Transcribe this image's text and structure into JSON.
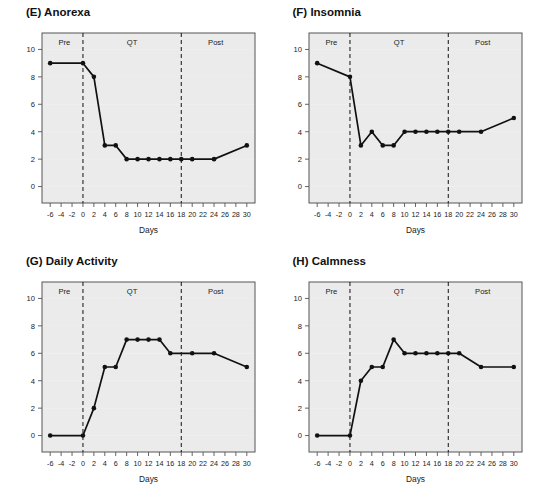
{
  "figure": {
    "width": 533,
    "height": 498,
    "background": "#ffffff",
    "panel_background": "#ebebeb",
    "series_color": "#111111",
    "divider_color": "#111111",
    "axis_color": "#555555"
  },
  "shared": {
    "xlabel": "Days",
    "xticks": [
      -6,
      -4,
      -2,
      0,
      2,
      4,
      6,
      8,
      10,
      12,
      14,
      16,
      18,
      20,
      22,
      24,
      26,
      28,
      30
    ],
    "yticks": [
      0,
      2,
      4,
      6,
      8,
      10
    ],
    "xlim": [
      -7.5,
      31.5
    ],
    "ylim": [
      -1.2,
      11.2
    ],
    "region_labels": [
      "Pre",
      "QT",
      "Post"
    ],
    "dividers": [
      0,
      18
    ]
  },
  "chart_data": [
    {
      "type": "line",
      "panel": "E",
      "title": "(E) Anorexa",
      "xlabel": "Days",
      "ylabel": "",
      "xlim": [
        -7.5,
        31.5
      ],
      "ylim": [
        -1.2,
        11.2
      ],
      "grid": false,
      "legend": "none",
      "annotations": [
        {
          "text": "Pre",
          "x": -3.4,
          "y": 10.3
        },
        {
          "text": "QT",
          "x": 9.0,
          "y": 10.3
        },
        {
          "text": "Post",
          "x": 24.3,
          "y": 10.3
        }
      ],
      "vlines": [
        0,
        18
      ],
      "x": [
        -6,
        0,
        2,
        4,
        6,
        8,
        10,
        12,
        14,
        16,
        18,
        20,
        24,
        30
      ],
      "values": [
        9,
        9,
        8,
        3,
        3,
        2,
        2,
        2,
        2,
        2,
        2,
        2,
        2,
        3
      ]
    },
    {
      "type": "line",
      "panel": "F",
      "title": "(F) Insomnia",
      "xlabel": "Days",
      "ylabel": "",
      "xlim": [
        -7.5,
        31.5
      ],
      "ylim": [
        -1.2,
        11.2
      ],
      "grid": false,
      "legend": "none",
      "annotations": [
        {
          "text": "Pre",
          "x": -3.4,
          "y": 10.3
        },
        {
          "text": "QT",
          "x": 9.0,
          "y": 10.3
        },
        {
          "text": "Post",
          "x": 24.3,
          "y": 10.3
        }
      ],
      "vlines": [
        0,
        18
      ],
      "x": [
        -6,
        0,
        2,
        4,
        6,
        8,
        10,
        12,
        14,
        16,
        18,
        20,
        24,
        30
      ],
      "values": [
        9,
        8,
        3,
        4,
        3,
        3,
        4,
        4,
        4,
        4,
        4,
        4,
        4,
        5
      ]
    },
    {
      "type": "line",
      "panel": "G",
      "title": "(G) Daily Activity",
      "xlabel": "Days",
      "ylabel": "",
      "xlim": [
        -7.5,
        31.5
      ],
      "ylim": [
        -1.2,
        11.2
      ],
      "grid": false,
      "legend": "none",
      "annotations": [
        {
          "text": "Pre",
          "x": -3.4,
          "y": 10.3
        },
        {
          "text": "QT",
          "x": 9.0,
          "y": 10.3
        },
        {
          "text": "Post",
          "x": 24.3,
          "y": 10.3
        }
      ],
      "vlines": [
        0,
        18
      ],
      "x": [
        -6,
        0,
        2,
        4,
        6,
        8,
        10,
        12,
        14,
        16,
        20,
        24,
        30
      ],
      "values": [
        0,
        0,
        2,
        5,
        5,
        7,
        7,
        7,
        7,
        6,
        6,
        6,
        5
      ]
    },
    {
      "type": "line",
      "panel": "H",
      "title": "(H) Calmness",
      "xlabel": "Days",
      "ylabel": "",
      "xlim": [
        -7.5,
        31.5
      ],
      "ylim": [
        -1.2,
        11.2
      ],
      "grid": false,
      "legend": "none",
      "annotations": [
        {
          "text": "Pre",
          "x": -3.4,
          "y": 10.3
        },
        {
          "text": "QT",
          "x": 9.0,
          "y": 10.3
        },
        {
          "text": "Post",
          "x": 24.3,
          "y": 10.3
        }
      ],
      "vlines": [
        0,
        18
      ],
      "x": [
        -6,
        0,
        2,
        4,
        6,
        8,
        10,
        12,
        14,
        16,
        18,
        20,
        24,
        30
      ],
      "values": [
        0,
        0,
        4,
        5,
        5,
        7,
        6,
        6,
        6,
        6,
        6,
        6,
        5,
        5
      ]
    }
  ]
}
